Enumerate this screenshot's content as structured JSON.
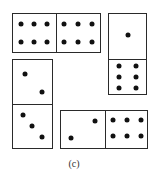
{
  "figure": {
    "label": "(c)",
    "dominoes": [
      {
        "id": "top-horizontal",
        "orientation": "horizontal",
        "values": [
          6,
          6
        ]
      },
      {
        "id": "right-vertical",
        "orientation": "vertical",
        "values": [
          1,
          6
        ]
      },
      {
        "id": "left-vertical",
        "orientation": "vertical",
        "values": [
          2,
          3
        ]
      },
      {
        "id": "bottom-horizontal",
        "orientation": "horizontal",
        "values": [
          2,
          6
        ]
      }
    ]
  }
}
